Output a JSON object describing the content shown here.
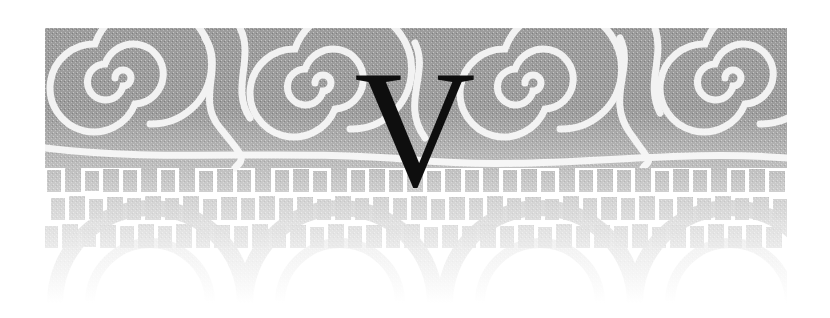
{
  "chapter": {
    "numeral": "V",
    "ornament": "spiral-and-tile-pattern",
    "colors": {
      "pattern_gray": "#9a9a9a",
      "gap_white": "#f4f4f4",
      "letter": "#0e0e0e",
      "background": "#ffffff"
    }
  }
}
